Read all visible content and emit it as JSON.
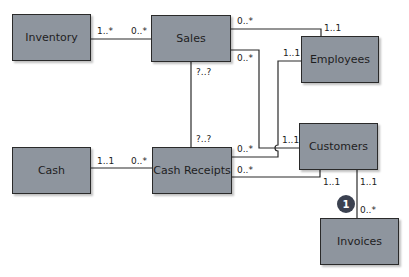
{
  "diagram": {
    "type": "uml-class-diagram",
    "colors": {
      "entity_fill": "#8e959e",
      "entity_border": "#2a2a2a",
      "badge_fill": "#3b4150",
      "line": "#2a2a2a"
    },
    "entities": {
      "inventory": "Inventory",
      "sales": "Sales",
      "employees": "Employees",
      "cash": "Cash",
      "cash_receipts": "Cash Receipts",
      "customers": "Customers",
      "invoices": "Invoices"
    },
    "relationships": [
      {
        "from": "Inventory",
        "to": "Sales",
        "from_card": "1..*",
        "to_card": "0..*"
      },
      {
        "from": "Sales",
        "to": "Employees",
        "from_card": "0..*",
        "to_card": "1..1"
      },
      {
        "from": "Sales",
        "to": "Customers",
        "from_card": "0..*",
        "to_card": "1..1"
      },
      {
        "from": "Sales",
        "to": "Cash Receipts",
        "from_card": "?..?",
        "to_card": "?..?"
      },
      {
        "from": "Cash",
        "to": "Cash Receipts",
        "from_card": "1..1",
        "to_card": "0..*"
      },
      {
        "from": "Cash Receipts",
        "to": "Employees",
        "from_card": "0..*",
        "to_card": "1..1"
      },
      {
        "from": "Cash Receipts",
        "to": "Customers",
        "from_card": "0..*",
        "to_card": "1..1"
      },
      {
        "from": "Customers",
        "to": "Invoices",
        "from_card": "1..1",
        "to_card": "0..*"
      }
    ],
    "labels": {
      "inv_sales_inv": "1..*",
      "inv_sales_sales": "0..*",
      "sales_emp_sales": "0..*",
      "sales_emp_emp": "1..1",
      "sales_cust_sales": "0..*",
      "sales_cust_cust": "1..1",
      "sales_cr_sales": "?..?",
      "sales_cr_cr": "?..?",
      "cash_cr_cash": "1..1",
      "cash_cr_cr": "0..*",
      "cr_emp_cr": "0..*",
      "cr_emp_emp": "1..1",
      "cr_cust_cr": "0..*",
      "cr_cust_cust": "1..1",
      "cust_inv_cust": "1..1",
      "cust_inv_inv": "0..*"
    },
    "badge": "1"
  }
}
